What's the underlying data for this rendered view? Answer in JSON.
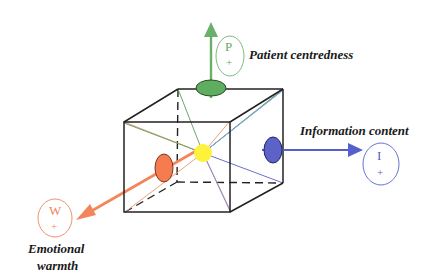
{
  "diagram": {
    "type": "3D cube model of communication dimensions",
    "center": {
      "color": "#fff23a"
    },
    "axes": [
      {
        "id": "patient",
        "label": "Patient centredness",
        "letter": "P",
        "sign": "+",
        "direction": "up",
        "color": "#5aa85a",
        "fill": "#5fae5f"
      },
      {
        "id": "information",
        "label": "Information content",
        "letter": "I",
        "sign": "+",
        "direction": "right",
        "color": "#5560cc",
        "fill": "#5c62c8"
      },
      {
        "id": "emotional",
        "label_line1": "Emotional",
        "label_line2": "warmth",
        "letter": "W",
        "sign": "+",
        "direction": "front-left",
        "color": "#f08a5a",
        "fill": "#f47c4e"
      }
    ]
  }
}
